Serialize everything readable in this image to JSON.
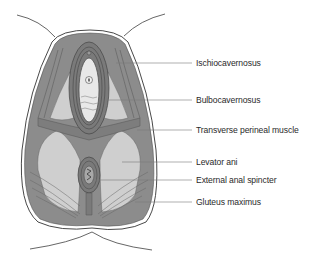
{
  "diagram": {
    "type": "anatomical illustration",
    "colors": {
      "muscle": "#8c8c8c",
      "muscle_dark": "#6e6e6e",
      "fossa": "#cfcfcf",
      "skin_outline": "#555555",
      "leader_line": "#7a7a7a",
      "text": "#2a2a2a"
    },
    "labels": [
      {
        "id": "ischiocavernosus",
        "text": "Ischiocavernosus",
        "x": 196,
        "y": 58
      },
      {
        "id": "bulbocavernosus",
        "text": "Bulbocavernosus",
        "x": 196,
        "y": 95
      },
      {
        "id": "transverse-perineal-muscle",
        "text": "Transverse perineal muscle",
        "x": 196,
        "y": 125
      },
      {
        "id": "levator-ani",
        "text": "Levator ani",
        "x": 196,
        "y": 158
      },
      {
        "id": "external-anal-spincter",
        "text": "External anal spincter",
        "x": 196,
        "y": 176
      },
      {
        "id": "gluteus-maximus",
        "text": "Gluteus maximus",
        "x": 196,
        "y": 197
      }
    ]
  }
}
